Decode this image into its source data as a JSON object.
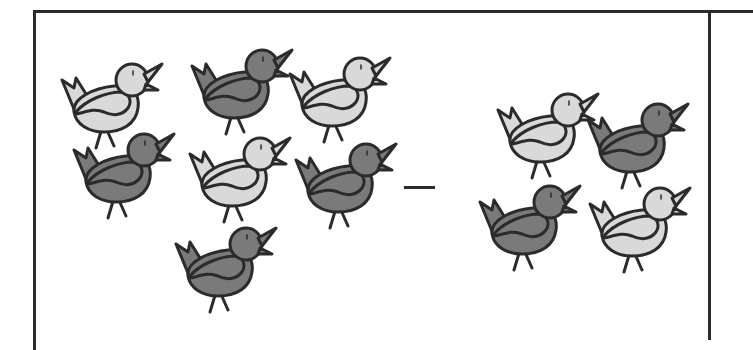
{
  "worksheet": {
    "operator": "minus",
    "colors": {
      "outline": "#2b2b2b",
      "light_fill": "#d9d9d9",
      "dark_fill": "#7a7a7a",
      "background": "#ffffff"
    },
    "left_group": {
      "count": 7,
      "birds": [
        {
          "shade": "light",
          "x": 58,
          "y": 58
        },
        {
          "shade": "dark",
          "x": 188,
          "y": 44
        },
        {
          "shade": "light",
          "x": 286,
          "y": 52
        },
        {
          "shade": "dark",
          "x": 70,
          "y": 128
        },
        {
          "shade": "light",
          "x": 186,
          "y": 132
        },
        {
          "shade": "dark",
          "x": 292,
          "y": 138
        },
        {
          "shade": "dark",
          "x": 172,
          "y": 222
        }
      ]
    },
    "right_group": {
      "count": 4,
      "birds": [
        {
          "shade": "light",
          "x": 494,
          "y": 88
        },
        {
          "shade": "dark",
          "x": 584,
          "y": 98
        },
        {
          "shade": "dark",
          "x": 476,
          "y": 180
        },
        {
          "shade": "light",
          "x": 586,
          "y": 182
        }
      ]
    }
  }
}
